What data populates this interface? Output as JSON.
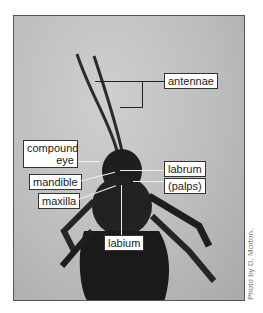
{
  "figure": {
    "labels": {
      "antennae": "antennae",
      "compound_eye_line1": "compound",
      "compound_eye_line2": "eye",
      "mandible": "mandible",
      "maxilla": "maxilla",
      "labrum": "labrum",
      "palps": "(palps)",
      "labium": "labium"
    },
    "credit": "Photo by D. Morton."
  }
}
